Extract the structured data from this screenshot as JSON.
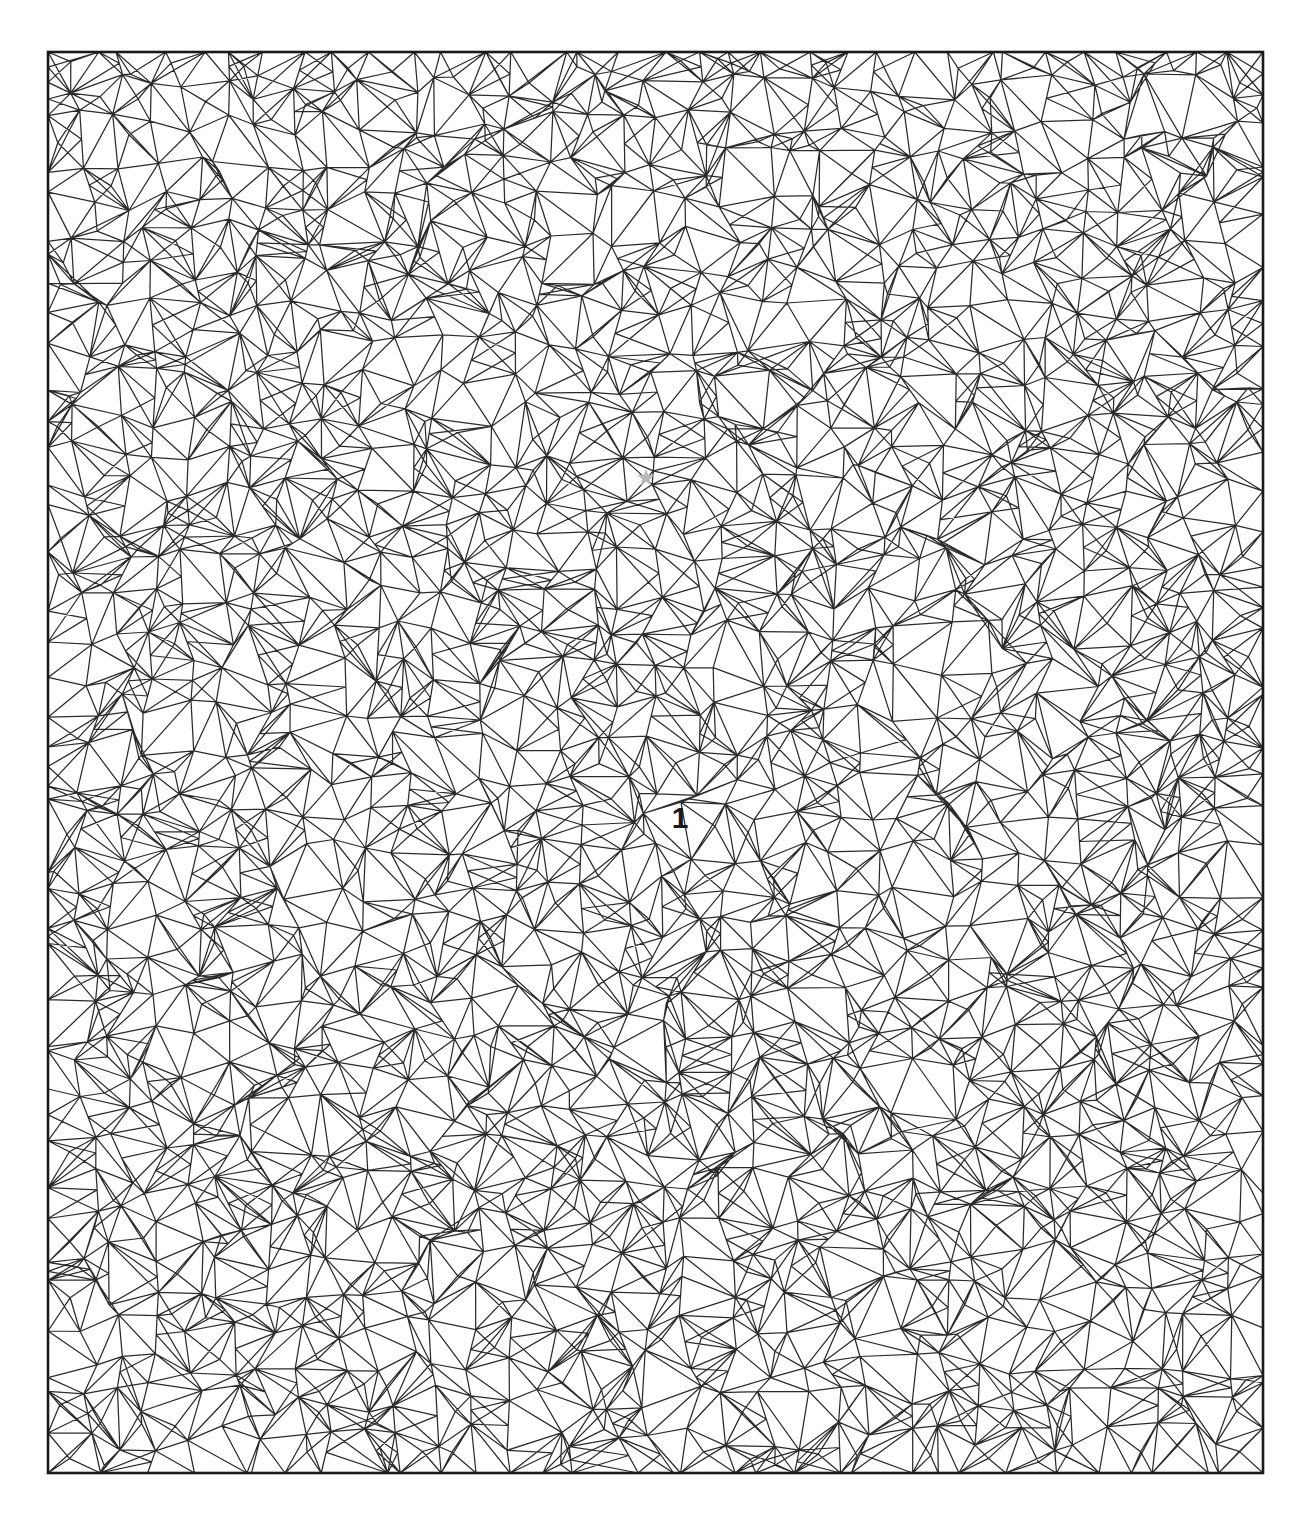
{
  "figure": {
    "title": "",
    "type": "triangular-mesh-diagram",
    "background_color": "#ffffff",
    "edge_color": "#2b2b2b",
    "boundary_color": "#1a1a1a",
    "marker_color": "#b9b9b9"
  },
  "domain": {
    "name": "mesh-domain",
    "x_min": 48,
    "y_min": 52,
    "x_max": 1263,
    "y_max": 1473,
    "width": 1215,
    "height": 1421
  },
  "annotations": [
    {
      "name": "node-label-1",
      "text": "1",
      "x": 680,
      "y": 828,
      "color": "#1a1a1a",
      "font_size": 30
    }
  ],
  "markers": [
    {
      "name": "star-marker",
      "symbol": "star",
      "x": 646,
      "y": 478,
      "radius": 9,
      "color": "#b9b9b9"
    }
  ],
  "chart_data": {
    "type": "mesh",
    "title": "",
    "xlabel": "",
    "ylabel": "",
    "grid": false,
    "legend": null,
    "xlim": [
      48,
      1263
    ],
    "ylim": [
      52,
      1473
    ],
    "mesh": {
      "element_type": "triangle",
      "approx_nodes": 1150,
      "approx_elements": 2240,
      "nominal_cell_size": 36,
      "jitter_fraction": 0.42,
      "seed": 20240517,
      "uniform_density": true
    }
  }
}
